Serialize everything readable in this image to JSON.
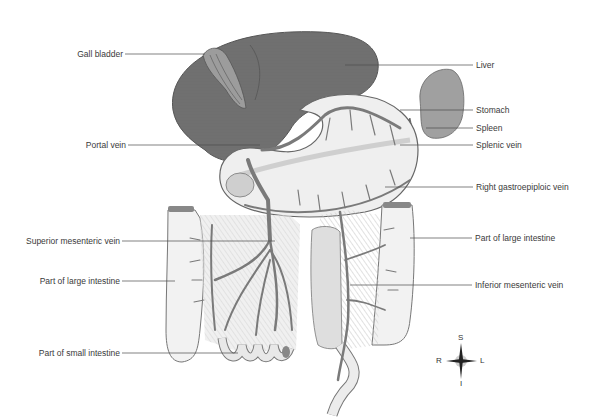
{
  "diagram": {
    "labels": {
      "gall_bladder": "Gall bladder",
      "portal_vein": "Portal vein",
      "superior_mesenteric_vein": "Superior mesenteric vein",
      "part_of_large_intestine_left": "Part of large intestine",
      "part_of_small_intestine": "Part of small intestine",
      "liver": "Liver",
      "stomach": "Stomach",
      "spleen": "Spleen",
      "splenic_vein": "Splenic vein",
      "right_gastroepiploic_vein": "Right gastroepiploic vein",
      "part_of_large_intestine_right": "Part of large intestine",
      "inferior_mesenteric_vein": "Inferior mesenteric vein"
    },
    "compass": {
      "superior": "S",
      "inferior": "I",
      "right": "R",
      "left": "L"
    },
    "colors": {
      "liver": "#6e6e6e",
      "vein": "#7a7a7a",
      "organ_light": "#ededed",
      "spleen": "#9a9a9a",
      "mesentery": "#d8d8d8",
      "leader_line": "#4a4a4a",
      "text": "#3a3a3a"
    }
  }
}
